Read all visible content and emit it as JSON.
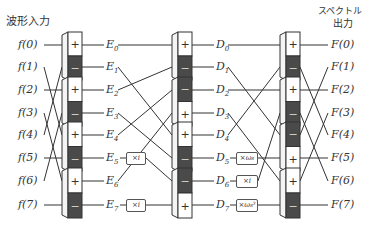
{
  "headers": {
    "input": "波形入力",
    "output_line1": "スペクトル",
    "output_line2": "出力"
  },
  "inputs": [
    "f(0)",
    "f(1)",
    "f(2)",
    "f(3)",
    "f(4)",
    "f(5)",
    "f(6)",
    "f(7)"
  ],
  "stage1_outputs": [
    "E0",
    "E1",
    "E2",
    "E3",
    "E4",
    "E5",
    "E6",
    "E7"
  ],
  "stage2_outputs": [
    "D0",
    "D1",
    "D2",
    "D3",
    "D4",
    "D5",
    "D6",
    "D7"
  ],
  "outputs": [
    "F(0)",
    "F(1)",
    "F(2)",
    "F(3)",
    "F(4)",
    "F(5)",
    "F(6)",
    "F(7)"
  ],
  "multipliers": {
    "stage1": [
      {
        "row": 5,
        "label": "×i"
      },
      {
        "row": 7,
        "label": "×i"
      }
    ],
    "stage2": [
      {
        "row": 5,
        "label": "×ω₈"
      },
      {
        "row": 6,
        "label": "×i"
      },
      {
        "row": 7,
        "label": "×ω₈³"
      }
    ]
  },
  "butterflies": {
    "stage1": [
      {
        "top": "+",
        "bottom": "−"
      },
      {
        "top": "+",
        "bottom": "−"
      },
      {
        "top": "+",
        "bottom": "−"
      },
      {
        "top": "+",
        "bottom": "−"
      }
    ],
    "stage2": [
      {
        "top": "+",
        "bottom": "−"
      },
      {
        "top": "−",
        "bottom": "+"
      },
      {
        "top": "+",
        "bottom": "−"
      },
      {
        "top": "−",
        "bottom": "+"
      }
    ],
    "stage3": [
      {
        "top": "+",
        "bottom": "−"
      },
      {
        "top": "+",
        "bottom": "−"
      },
      {
        "top": "−",
        "bottom": "+"
      },
      {
        "top": "+",
        "bottom": "−"
      }
    ]
  },
  "colors": {
    "dark_cell": "#4a4a4a",
    "light_cell": "#ffffff",
    "line": "#333333"
  }
}
